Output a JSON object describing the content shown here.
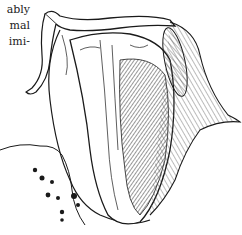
{
  "text_fragment": {
    "lines": [
      "ably",
      "mal",
      "imi-"
    ]
  },
  "figure": {
    "ink_color": "#1a1a1a",
    "paper_color": "#ffffff",
    "shade_color": "#8a8a8a"
  }
}
